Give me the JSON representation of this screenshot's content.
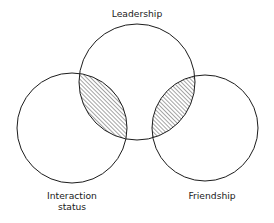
{
  "figure": {
    "background_color": "#ffffff",
    "stroke_color": "#1c1c1c",
    "text_color": "#1a1a1a",
    "hatch_color": "#2b2b2b"
  },
  "chart_data": {
    "type": "venn",
    "title": "",
    "sets": [
      {
        "id": "leadership",
        "label": "Leadership",
        "cx": 137,
        "cy": 82,
        "r": 58,
        "label_x": 137,
        "label_y": 17,
        "label_lines": [
          "Leadership"
        ],
        "filled": false
      },
      {
        "id": "interaction-status",
        "label": "Interaction status",
        "cx": 72,
        "cy": 128,
        "r": 55,
        "label_x": 72,
        "label_y": 199,
        "label_lines": [
          "Interaction",
          "status"
        ],
        "filled": false
      },
      {
        "id": "friendship",
        "label": "Friendship",
        "cx": 205,
        "cy": 128,
        "r": 53,
        "label_x": 212,
        "label_y": 199,
        "label_lines": [
          "Friendship"
        ],
        "filled": false
      }
    ],
    "intersections": [
      {
        "id": "leadership-interaction",
        "sets": [
          "leadership",
          "interaction-status"
        ],
        "shaded": true,
        "hatch": "diagonal-forward",
        "hatch_spacing_px": 2,
        "hatch_angle_deg": 45
      },
      {
        "id": "leadership-friendship",
        "sets": [
          "leadership",
          "friendship"
        ],
        "shaded": true,
        "hatch": "diagonal-forward",
        "hatch_spacing_px": 2,
        "hatch_angle_deg": 45
      },
      {
        "id": "interaction-friendship",
        "sets": [
          "interaction-status",
          "friendship"
        ],
        "shaded": false,
        "hatch": "none"
      }
    ],
    "legend": null,
    "grid": false,
    "xlabel": "",
    "ylabel": ""
  }
}
